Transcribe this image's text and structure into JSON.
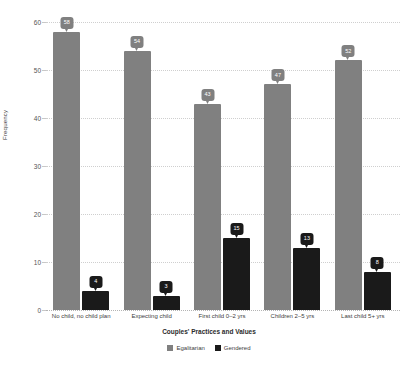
{
  "chart_data": {
    "type": "bar",
    "title": "",
    "xlabel": "Couples' Practices and Values",
    "ylabel": "Frequency",
    "ylim": [
      0,
      60
    ],
    "yticks": [
      0,
      10,
      20,
      30,
      40,
      50,
      60
    ],
    "grid": true,
    "legend_position": "bottom",
    "categories": [
      "No child, no child plan",
      "Expecting child",
      "First child 0–2 yrs",
      "Children 2–5 yrs",
      "Last child 5+ yrs"
    ],
    "series": [
      {
        "name": "Egalitarian",
        "color": "#808080",
        "values": [
          58,
          54,
          43,
          47,
          52
        ]
      },
      {
        "name": "Gendered",
        "color": "#1a1a1a",
        "values": [
          4,
          3,
          15,
          13,
          8
        ]
      }
    ]
  },
  "axis": {
    "y_title": "Frequency",
    "x_title": "Couples' Practices and Values",
    "y_ticks": [
      "0",
      "10",
      "20",
      "30",
      "40",
      "50",
      "60"
    ]
  },
  "legend": {
    "items": [
      {
        "label": "Egalitarian",
        "color": "#808080"
      },
      {
        "label": "Gendered",
        "color": "#1a1a1a"
      }
    ]
  }
}
